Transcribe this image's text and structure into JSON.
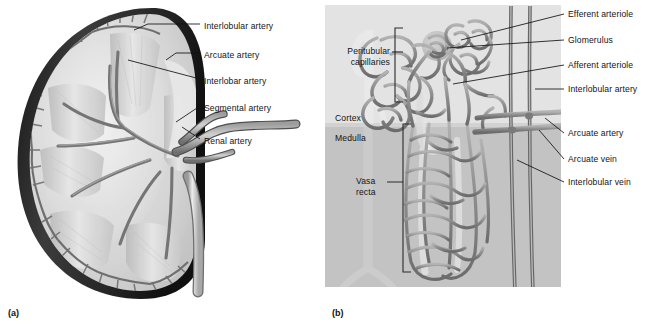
{
  "figure": {
    "panels": [
      {
        "letter": "(a)",
        "name": "kidney-arterial-supply",
        "labels": [
          {
            "id": "interlobular-artery",
            "text": "Interlobular artery",
            "x": 204,
            "y": 27
          },
          {
            "id": "arcuate-artery",
            "text": "Arcuate artery",
            "x": 204,
            "y": 56
          },
          {
            "id": "interlobar-artery",
            "text": "Interlobar artery",
            "x": 204,
            "y": 82
          },
          {
            "id": "segmental-artery",
            "text": "Segmental artery",
            "x": 204,
            "y": 109
          },
          {
            "id": "renal-artery",
            "text": "Renal artery",
            "x": 204,
            "y": 142
          }
        ]
      },
      {
        "letter": "(b)",
        "name": "nephron-microcirculation",
        "labels_left": [
          {
            "id": "peritubular-capillaries",
            "text": "Peritubular capillaries",
            "x": 3,
            "y": 52
          },
          {
            "id": "cortex",
            "text": "Cortex",
            "x": 10,
            "y": 118
          },
          {
            "id": "medulla",
            "text": "Medulla",
            "x": 10,
            "y": 138
          },
          {
            "id": "vasa-recta",
            "text": "Vasa recta",
            "x": 38,
            "y": 182
          }
        ],
        "labels_right": [
          {
            "id": "efferent-arteriole",
            "text": "Efferent arteriole",
            "x": 243,
            "y": 17
          },
          {
            "id": "glomerulus",
            "text": "Glomerulus",
            "x": 243,
            "y": 43
          },
          {
            "id": "afferent-arteriole",
            "text": "Afferent arteriole",
            "x": 243,
            "y": 68
          },
          {
            "id": "interlobular-artery",
            "text": "Interlobular artery",
            "x": 243,
            "y": 92
          },
          {
            "id": "arcuate-artery",
            "text": "Arcuate artery",
            "x": 243,
            "y": 136
          },
          {
            "id": "arcuate-vein",
            "text": "Arcuate vein",
            "x": 243,
            "y": 162
          },
          {
            "id": "interlobular-vein",
            "text": "Interlobular vein",
            "x": 243,
            "y": 185
          }
        ]
      }
    ],
    "colors": {
      "capsule_dark": "#2e2e2e",
      "cortex_light": "#d9d9d9",
      "medulla_mid": "#b4b4b4",
      "vessel_gray": "#8d8d8d",
      "vessel_outline": "#4a4a4a",
      "panel_bg_cortex": "#e0e0e0",
      "panel_bg_medulla": "#c2c2c2",
      "leader_line": "#121212",
      "text": "#141414"
    }
  }
}
